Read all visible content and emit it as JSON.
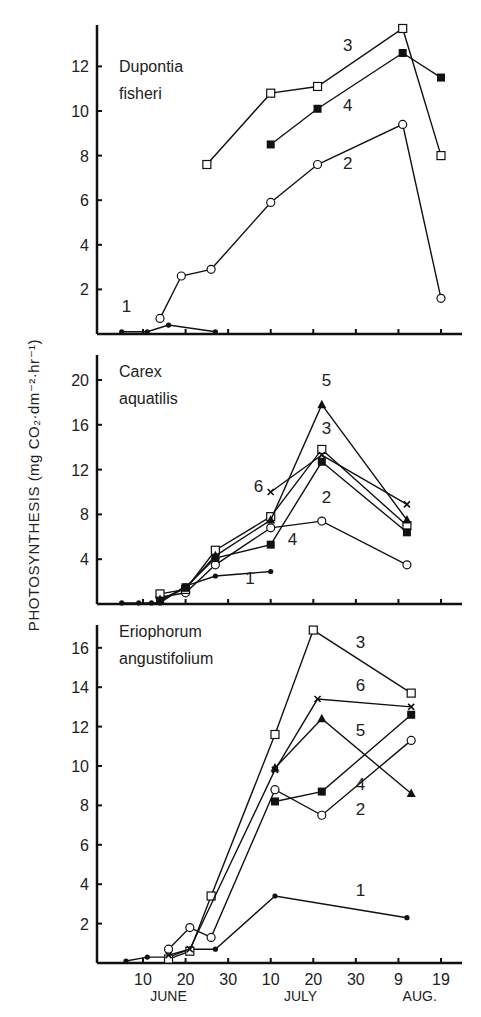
{
  "chart_data": [
    {
      "type": "line",
      "title": "Dupontia fisheri",
      "title_lines": [
        "Dupontia",
        "fisheri"
      ],
      "xlabel": "",
      "ylabel": "PHOTOSYNTHESIS (mg CO2·dm-2·hr-1)",
      "ylim": [
        0,
        14
      ],
      "yticks": [
        2,
        4,
        6,
        8,
        10,
        12
      ],
      "x_unit": "day of season (June 1 = 1)",
      "series": [
        {
          "name": "1",
          "marker": "filled-circle-small",
          "points": [
            [
              5,
              0.1
            ],
            [
              11,
              0.1
            ],
            [
              16,
              0.4
            ],
            [
              27,
              0.1
            ]
          ]
        },
        {
          "name": "2",
          "marker": "open-circle",
          "points": [
            [
              14,
              0.7
            ],
            [
              19,
              2.6
            ],
            [
              26,
              2.9
            ],
            [
              40,
              5.9
            ],
            [
              51,
              7.6
            ],
            [
              71,
              9.4
            ],
            [
              80,
              1.6
            ]
          ]
        },
        {
          "name": "3",
          "marker": "open-square",
          "points": [
            [
              25,
              7.6
            ],
            [
              40,
              10.8
            ],
            [
              51,
              11.1
            ],
            [
              71,
              13.7
            ],
            [
              80,
              8.0
            ]
          ]
        },
        {
          "name": "4",
          "marker": "filled-square",
          "points": [
            [
              40,
              8.5
            ],
            [
              51,
              10.1
            ],
            [
              71,
              12.6
            ],
            [
              80,
              11.5
            ]
          ]
        }
      ],
      "labels": [
        {
          "text": "1",
          "at": [
            5,
            1.0
          ]
        },
        {
          "text": "2",
          "at": [
            57,
            7.4
          ]
        },
        {
          "text": "3",
          "at": [
            57,
            12.7
          ]
        },
        {
          "text": "4",
          "at": [
            57,
            10.0
          ]
        }
      ],
      "grid": false,
      "legend": "inline-labels"
    },
    {
      "type": "line",
      "title": "Carex aquatilis",
      "title_lines": [
        "Carex",
        "aquatilis"
      ],
      "ylim": [
        0,
        22
      ],
      "yticks": [
        4,
        8,
        12,
        16,
        20
      ],
      "series": [
        {
          "name": "1",
          "marker": "filled-circle-small",
          "points": [
            [
              5,
              0.1
            ],
            [
              9,
              0.1
            ],
            [
              12,
              0.1
            ],
            [
              14,
              0.1
            ],
            [
              20,
              1.6
            ],
            [
              27,
              2.5
            ],
            [
              40,
              2.9
            ]
          ]
        },
        {
          "name": "2",
          "marker": "open-circle",
          "points": [
            [
              14,
              0.6
            ],
            [
              20,
              1.0
            ],
            [
              27,
              3.5
            ],
            [
              40,
              6.8
            ],
            [
              52,
              7.4
            ],
            [
              72,
              3.5
            ]
          ]
        },
        {
          "name": "3",
          "marker": "open-square",
          "points": [
            [
              14,
              0.9
            ],
            [
              20,
              1.3
            ],
            [
              27,
              4.8
            ],
            [
              40,
              7.8
            ],
            [
              52,
              13.8
            ],
            [
              72,
              7.0
            ]
          ]
        },
        {
          "name": "4",
          "marker": "filled-square",
          "points": [
            [
              14,
              0.3
            ],
            [
              20,
              1.5
            ],
            [
              27,
              4.1
            ],
            [
              40,
              5.3
            ],
            [
              52,
              12.7
            ],
            [
              72,
              6.4
            ]
          ]
        },
        {
          "name": "5",
          "marker": "filled-triangle",
          "points": [
            [
              14,
              0.4
            ],
            [
              20,
              1.4
            ],
            [
              27,
              4.3
            ],
            [
              40,
              7.5
            ],
            [
              52,
              17.8
            ],
            [
              72,
              7.5
            ]
          ]
        },
        {
          "name": "6",
          "marker": "cross",
          "points": [
            [
              40,
              10.0
            ],
            [
              52,
              13.3
            ],
            [
              72,
              8.9
            ]
          ]
        }
      ],
      "labels": [
        {
          "text": "1",
          "at": [
            34,
            1.8
          ]
        },
        {
          "text": "2",
          "at": [
            52,
            9.0
          ]
        },
        {
          "text": "3",
          "at": [
            52,
            15.2
          ]
        },
        {
          "text": "4",
          "at": [
            44,
            5.3
          ]
        },
        {
          "text": "5",
          "at": [
            52,
            19.5
          ]
        },
        {
          "text": "6",
          "at": [
            36,
            10.0
          ]
        }
      ],
      "grid": false,
      "legend": "inline-labels"
    },
    {
      "type": "line",
      "title": "Eriophorum angustifolium",
      "title_lines": [
        "Eriophorum",
        "angustifolium"
      ],
      "ylim": [
        0,
        17
      ],
      "yticks": [
        2,
        4,
        6,
        8,
        10,
        12,
        14,
        16
      ],
      "xticks": [
        {
          "day": 10,
          "label": "10"
        },
        {
          "day": 20,
          "label": "20"
        },
        {
          "day": 30,
          "label": "30"
        },
        {
          "day": 40,
          "label": "10"
        },
        {
          "day": 50,
          "label": "20"
        },
        {
          "day": 60,
          "label": "30"
        },
        {
          "day": 70,
          "label": "9"
        },
        {
          "day": 80,
          "label": "19"
        }
      ],
      "month_labels": [
        {
          "text": "JUNE",
          "day": 16
        },
        {
          "text": "JULY",
          "day": 47
        },
        {
          "text": "AUG.",
          "day": 75
        }
      ],
      "series": [
        {
          "name": "1",
          "marker": "filled-circle-small",
          "points": [
            [
              6,
              0.1
            ],
            [
              11,
              0.3
            ],
            [
              16,
              0.3
            ],
            [
              21,
              0.7
            ],
            [
              27,
              0.7
            ],
            [
              41,
              3.4
            ],
            [
              72,
              2.3
            ]
          ]
        },
        {
          "name": "2",
          "marker": "open-circle",
          "points": [
            [
              16,
              0.7
            ],
            [
              21,
              1.8
            ],
            [
              26,
              1.3
            ],
            [
              41,
              8.8
            ],
            [
              52,
              7.5
            ],
            [
              73,
              11.3
            ]
          ]
        },
        {
          "name": "3",
          "marker": "open-square",
          "points": [
            [
              16,
              0.2
            ],
            [
              21,
              0.6
            ],
            [
              26,
              3.4
            ],
            [
              41,
              11.6
            ],
            [
              50,
              16.9
            ],
            [
              73,
              13.7
            ]
          ]
        },
        {
          "name": "4",
          "marker": "filled-square",
          "points": [
            [
              41,
              8.2
            ],
            [
              52,
              8.7
            ],
            [
              73,
              12.6
            ]
          ]
        },
        {
          "name": "5",
          "marker": "filled-triangle",
          "points": [
            [
              41,
              9.9
            ],
            [
              52,
              12.4
            ],
            [
              73,
              8.6
            ]
          ]
        },
        {
          "name": "6",
          "marker": "cross",
          "points": [
            [
              16,
              0.4
            ],
            [
              21,
              0.7
            ],
            [
              41,
              9.8
            ],
            [
              51,
              13.4
            ],
            [
              73,
              13.0
            ]
          ]
        }
      ],
      "labels": [
        {
          "text": "1",
          "at": [
            60,
            3.4
          ]
        },
        {
          "text": "2",
          "at": [
            60,
            7.5
          ]
        },
        {
          "text": "3",
          "at": [
            60,
            16.0
          ]
        },
        {
          "text": "4",
          "at": [
            60,
            8.8
          ]
        },
        {
          "text": "5",
          "at": [
            60,
            11.5
          ]
        },
        {
          "text": "6",
          "at": [
            60,
            13.8
          ]
        }
      ],
      "grid": false,
      "legend": "inline-labels"
    }
  ],
  "figure": {
    "ylabel_shared": "PHOTOSYNTHESIS (mg CO₂·dm⁻²·hr⁻¹)"
  }
}
